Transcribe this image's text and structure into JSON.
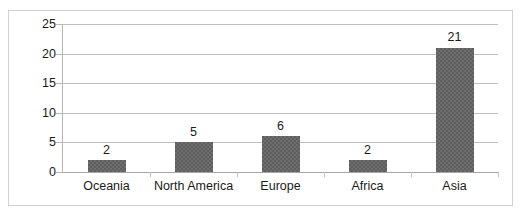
{
  "chart_data": {
    "type": "bar",
    "title": "",
    "subtitle": "",
    "xlabel": "",
    "ylabel": "",
    "categories": [
      "Oceania",
      "North America",
      "Europe",
      "Africa",
      "Asia"
    ],
    "values": [
      2,
      5,
      6,
      2,
      21
    ],
    "data_labels": [
      "2",
      "5",
      "6",
      "2",
      "21"
    ],
    "ylim": [
      0,
      25
    ],
    "yticks": [
      0,
      5,
      10,
      15,
      20,
      25
    ],
    "ytick_labels": [
      "0",
      "5",
      "10",
      "15",
      "20",
      "25"
    ],
    "grid": "horizontal",
    "legend": "none",
    "series": [
      {
        "name": "",
        "values": [
          2,
          5,
          6,
          2,
          21
        ]
      }
    ]
  },
  "style": {
    "bar_color": "#5e5e5e",
    "gridline_color": "#bfbfbf",
    "axis_color": "#b8b8b8",
    "frame_color": "#d2d2d2",
    "text_color": "#1a1a1a",
    "background": "#ffffff"
  }
}
